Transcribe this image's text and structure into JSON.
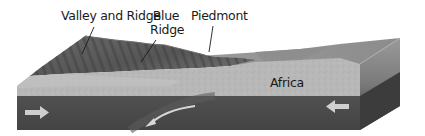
{
  "figure": {
    "type": "block-diagram",
    "labels": {
      "valley_and_ridge": "Valley and Ridge",
      "blue_ridge_line1": "Blue",
      "blue_ridge_line2": "Ridge",
      "piedmont": "Piedmont",
      "africa": "Africa"
    },
    "arrows": [
      {
        "name": "left-plate-motion-arrow",
        "direction": "right",
        "color": "#c8c8c8"
      },
      {
        "name": "right-plate-motion-arrow",
        "direction": "left",
        "color": "#c8c8c8"
      },
      {
        "name": "subduction-arrow",
        "direction": "down-left-curve",
        "color": "#d8d8d8"
      }
    ],
    "colors": {
      "ridges_dark": "#555555",
      "ridges_light": "#8a8a8a",
      "crust_light": "#b8b8b8",
      "mantle_dark": "#4a4a4a",
      "side_face": "#7a7a7a",
      "plain_surface": "#a0a0a0",
      "leader_lines": "#1a1a1a"
    }
  }
}
